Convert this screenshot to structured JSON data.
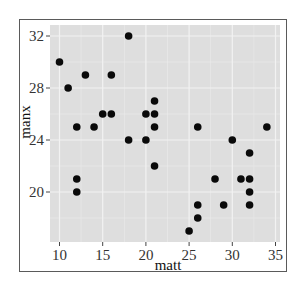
{
  "chart_data": {
    "type": "scatter",
    "title": "",
    "xlabel": "matt",
    "ylabel": "manx",
    "xlim": [
      8.8,
      35.5
    ],
    "ylim": [
      16.2,
      32.9
    ],
    "x_ticks": [
      10,
      15,
      20,
      25,
      30,
      35
    ],
    "y_ticks": [
      20,
      24,
      28,
      32
    ],
    "grid": true,
    "legend": null,
    "colors": {
      "panel_bg": "#dedede",
      "grid": "#f2f2f2",
      "point": "#0a0a0a",
      "frame": "#5a5a5a"
    },
    "points": [
      {
        "x": 10,
        "y": 30
      },
      {
        "x": 11,
        "y": 28
      },
      {
        "x": 12,
        "y": 25
      },
      {
        "x": 12,
        "y": 21
      },
      {
        "x": 12,
        "y": 20
      },
      {
        "x": 13,
        "y": 29
      },
      {
        "x": 14,
        "y": 25
      },
      {
        "x": 15,
        "y": 26
      },
      {
        "x": 16,
        "y": 26
      },
      {
        "x": 16,
        "y": 29
      },
      {
        "x": 18,
        "y": 32
      },
      {
        "x": 18,
        "y": 24
      },
      {
        "x": 20,
        "y": 26
      },
      {
        "x": 20,
        "y": 24
      },
      {
        "x": 21,
        "y": 27
      },
      {
        "x": 21,
        "y": 26
      },
      {
        "x": 21,
        "y": 25
      },
      {
        "x": 21,
        "y": 22
      },
      {
        "x": 25,
        "y": 17
      },
      {
        "x": 26,
        "y": 25
      },
      {
        "x": 26,
        "y": 19
      },
      {
        "x": 26,
        "y": 18
      },
      {
        "x": 28,
        "y": 21
      },
      {
        "x": 29,
        "y": 19
      },
      {
        "x": 30,
        "y": 24
      },
      {
        "x": 31,
        "y": 21
      },
      {
        "x": 32,
        "y": 23
      },
      {
        "x": 32,
        "y": 21
      },
      {
        "x": 32,
        "y": 20
      },
      {
        "x": 32,
        "y": 19
      },
      {
        "x": 34,
        "y": 25
      }
    ]
  }
}
